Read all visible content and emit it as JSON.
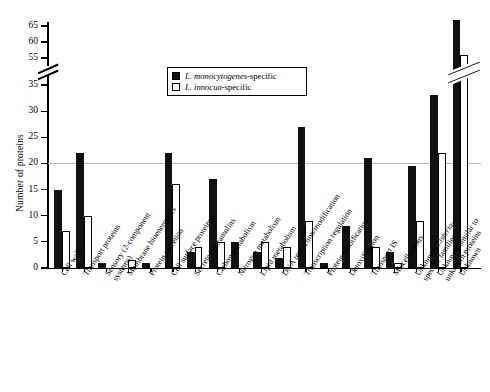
{
  "chart": {
    "type": "bar",
    "ylabel": "Number of proteins",
    "legend": [
      {
        "key": "mono",
        "label_italic": "L. monocytogenes",
        "label_roman": "-specific",
        "swatch": "filled-black"
      },
      {
        "key": "inno",
        "label_italic": "L. innocua",
        "label_roman": "-specific",
        "swatch": "open-white"
      }
    ]
  },
  "yaxis": {
    "ticks_lower": [
      0,
      5,
      10,
      15,
      20,
      25,
      30,
      35
    ],
    "ticks_upper": [
      55,
      60,
      65
    ],
    "break_between": [
      35,
      55
    ],
    "gridline_at": 20,
    "title": "Number of proteins"
  },
  "chart_data": {
    "type": "bar",
    "title": "",
    "xlabel": "",
    "ylabel": "Number of proteins",
    "ylim": [
      0,
      68
    ],
    "axis_break": [
      35,
      55
    ],
    "grid": true,
    "legend_position": "top-center",
    "categories": [
      "Cell wall",
      "Transport proteins",
      "Sensory (2-component systems)",
      "Membrane bioenergetics",
      "Protein secretion",
      "Cell surface proteins",
      "Secreted intramulins",
      "Carbon metabolism",
      "Nitrogen metabolism",
      "Lipid metabolism",
      "DNA restriction/modification",
      "Transcription regulation",
      "Protein modification",
      "Detoxification",
      "Transport IS",
      "Miscellaneous",
      "Unknown, Listeria-specific families",
      "Unknown, similar to unknown proteins",
      "Unknown"
    ],
    "categories_display": [
      "Cell wall",
      "Transport proteins",
      "Sensory (2-component systems)",
      "Membrane bioenergetics",
      "Protein secretion",
      "Cell surface proteins",
      "Secreted intramulins",
      "Carbon metabolism",
      "Nitrogen metabolism",
      "Lipid metabolism",
      "DNA restriction/modification",
      "Transcription regulation",
      "Protein modification",
      "Detoxification",
      "Transport IS",
      "Miscellaneous",
      "Unknown, Listeria-specific families",
      "Unknown, similar to unknown proteins",
      "Unknown"
    ],
    "series": [
      {
        "name": "L. monocytogenes-specific",
        "color": "#111111",
        "values": [
          15,
          22,
          1,
          0,
          1,
          22,
          3,
          17,
          5,
          3,
          2,
          27,
          1,
          8,
          21,
          3,
          19.5,
          33,
          67
        ]
      },
      {
        "name": "L. innocua-specific",
        "color": "#ffffff",
        "values": [
          7,
          10,
          0,
          1.5,
          1,
          16,
          4,
          5,
          0,
          5,
          4,
          9,
          0,
          4,
          1,
          9,
          22,
          56,
          0
        ]
      }
    ]
  },
  "bars": [
    {
      "cat": "Cell wall",
      "mono": 15,
      "inno": 7
    },
    {
      "cat": "Transport proteins",
      "mono": 22,
      "inno": 10
    },
    {
      "cat": "Sensory (2-component systems)",
      "mono": 1,
      "inno": 0
    },
    {
      "cat": "Membrane bioenergetics",
      "mono": 0,
      "inno": 1.5
    },
    {
      "cat": "Protein secretion",
      "mono": 1,
      "inno": 0
    },
    {
      "cat": "Cell surface proteins",
      "mono": 22,
      "inno": 16
    },
    {
      "cat": "Secreted intramulins",
      "mono": 3,
      "inno": 4
    },
    {
      "cat": "Carbon metabolism",
      "mono": 17,
      "inno": 5
    },
    {
      "cat": "Nitrogen metabolism",
      "mono": 5,
      "inno": 0
    },
    {
      "cat": "Lipid metabolism",
      "mono": 3,
      "inno": 5
    },
    {
      "cat": "DNA restriction/modification",
      "mono": 2,
      "inno": 4
    },
    {
      "cat": "Transcription regulation",
      "mono": 27,
      "inno": 9
    },
    {
      "cat": "Protein modification",
      "mono": 1,
      "inno": 0
    },
    {
      "cat": "Detoxification",
      "mono": 8,
      "inno": 0
    },
    {
      "cat": "Transport IS",
      "mono": 21,
      "inno": 4
    },
    {
      "cat": "Miscellaneous",
      "mono": 3,
      "inno": 1
    },
    {
      "cat": "Unknown, Listeria-specific families",
      "mono": 19.5,
      "inno": 9
    },
    {
      "cat": "Unknown, similar to unknown proteins",
      "mono": 33,
      "inno": 22
    },
    {
      "cat": "Unknown",
      "mono": 67,
      "inno": 56
    }
  ],
  "xlabels": [
    {
      "l1": "Cell wall",
      "l2": "",
      "italic_part": ""
    },
    {
      "l1": "Transport proteins",
      "l2": "",
      "italic_part": ""
    },
    {
      "l1": "Sensory (2-component",
      "l2": "systems)",
      "italic_part": ""
    },
    {
      "l1": "Membrane bioenergetics",
      "l2": "",
      "italic_part": ""
    },
    {
      "l1": "Protein secretion",
      "l2": "",
      "italic_part": ""
    },
    {
      "l1": "Cell surface proteins",
      "l2": "",
      "italic_part": ""
    },
    {
      "l1": "Secreted intramulins",
      "l2": "",
      "italic_part": ""
    },
    {
      "l1": "Carbon metabolism",
      "l2": "",
      "italic_part": ""
    },
    {
      "l1": "Nitrogen metabolism",
      "l2": "",
      "italic_part": ""
    },
    {
      "l1": "Lipid metabolism",
      "l2": "",
      "italic_part": ""
    },
    {
      "l1": "DNA restriction/modification",
      "l2": "",
      "italic_part": ""
    },
    {
      "l1": "Transcription regulation",
      "l2": "",
      "italic_part": ""
    },
    {
      "l1": "Protein modification",
      "l2": "",
      "italic_part": ""
    },
    {
      "l1": "Detoxification",
      "l2": "",
      "italic_part": ""
    },
    {
      "l1": "Transport IS",
      "l2": "",
      "italic_part": ""
    },
    {
      "l1": "Miscellaneous",
      "l2": "",
      "italic_part": ""
    },
    {
      "l1": "Unknown, Listeria-",
      "l2": "specific families",
      "italic_part": "Listeria"
    },
    {
      "l1": "Unknown, similar to",
      "l2": "unknown proteins",
      "italic_part": ""
    },
    {
      "l1": "Unknown",
      "l2": "",
      "italic_part": ""
    }
  ]
}
